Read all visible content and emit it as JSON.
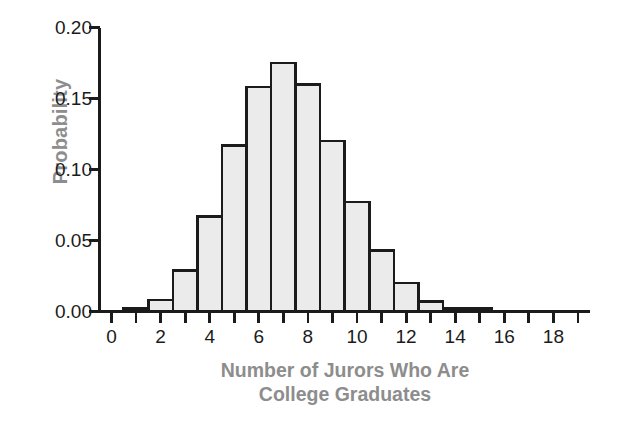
{
  "chart_data": {
    "type": "bar",
    "title": "",
    "subtitle": "",
    "xlabel_line1": "Number of Jurors Who Are",
    "xlabel_line2": "College Graduates",
    "xlabel": "Number of Jurors Who Are College Graduates",
    "ylabel": "Probability",
    "categories": [
      0,
      1,
      2,
      3,
      4,
      5,
      6,
      7,
      8,
      9,
      10,
      11,
      12,
      13,
      14,
      15,
      16,
      17,
      18,
      19
    ],
    "values": [
      0.0,
      0.002,
      0.008,
      0.029,
      0.067,
      0.117,
      0.158,
      0.175,
      0.16,
      0.12,
      0.077,
      0.043,
      0.02,
      0.007,
      0.002,
      0.002,
      0.0,
      0.0,
      0.0,
      0.0
    ],
    "xlim": [
      -0.5,
      19.5
    ],
    "ylim": [
      0.0,
      0.2
    ],
    "x_ticks": [
      0,
      1,
      2,
      3,
      4,
      5,
      6,
      7,
      8,
      9,
      10,
      11,
      12,
      13,
      14,
      15,
      16,
      17,
      18,
      19
    ],
    "x_tick_labels": [
      "0",
      "",
      "2",
      "",
      "4",
      "",
      "6",
      "",
      "8",
      "",
      "10",
      "",
      "12",
      "",
      "14",
      "",
      "16",
      "",
      "18",
      ""
    ],
    "y_ticks": [
      0.0,
      0.05,
      0.1,
      0.15,
      0.2
    ],
    "y_tick_labels": [
      "0.00",
      "0.05",
      "0.10",
      "0.15",
      "0.20"
    ],
    "grid": false,
    "legend": false,
    "legend_position": "none",
    "bar_fill_color": "#ebebeb",
    "bar_edge_color": "#1b1b1b",
    "axis_color": "#1b1b1b",
    "label_color": "#8d8d8d",
    "tick_label_color": "#1b1b1b",
    "background_color": "#ffffff"
  }
}
